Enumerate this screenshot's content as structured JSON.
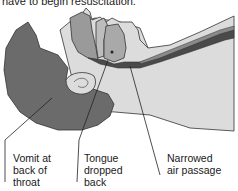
{
  "caption": {
    "text": "have to begin resuscitation."
  },
  "figure": {
    "colors": {
      "hair": "#6b6b6b",
      "skin": "#dcdcdc",
      "tongue": "#a9a9a9",
      "outline": "#333333",
      "airway_dark": "#4a4a4a"
    }
  },
  "labels": [
    {
      "id": "vomit",
      "lines": [
        "Vomit at",
        "back of",
        "throat"
      ]
    },
    {
      "id": "tongue",
      "lines": [
        "Tongue",
        "dropped",
        "back"
      ]
    },
    {
      "id": "air",
      "lines": [
        "Narrowed",
        "air passage"
      ]
    }
  ]
}
